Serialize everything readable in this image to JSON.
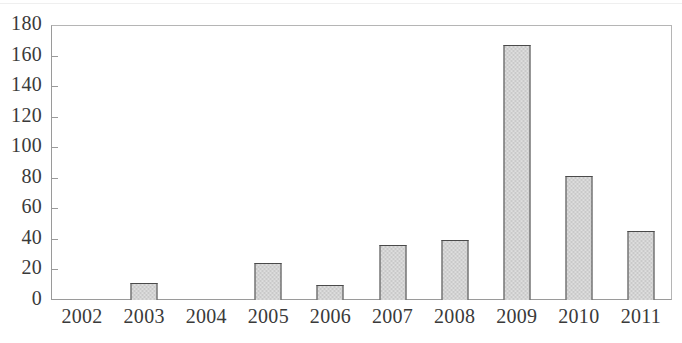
{
  "chart_data": {
    "type": "bar",
    "title": "",
    "subtitle": "",
    "xlabel": "",
    "ylabel": "",
    "categories": [
      "2002",
      "2003",
      "2004",
      "2005",
      "2006",
      "2007",
      "2008",
      "2009",
      "2010",
      "2011"
    ],
    "values": [
      0,
      11,
      0,
      24,
      10,
      36,
      39,
      167,
      81,
      45
    ],
    "ylim": [
      0,
      180
    ],
    "yticks": [
      0,
      20,
      40,
      60,
      80,
      100,
      120,
      140,
      160,
      180
    ],
    "ytick_labels": [
      "0",
      "20",
      "40",
      "60",
      "80",
      "100",
      "120",
      "140",
      "160",
      "180"
    ],
    "grid": false,
    "legend": null,
    "legend_position": "none",
    "annotations": [],
    "series": [
      {
        "name": "",
        "values": [
          0,
          11,
          0,
          24,
          10,
          36,
          39,
          167,
          81,
          45
        ]
      }
    ]
  },
  "style": {
    "bar_fill": "#c9c9c9",
    "bar_border": "#4a4a4a",
    "axis_color": "#9a9a9a",
    "text_color": "#3a3a3a",
    "background": "#ffffff"
  }
}
